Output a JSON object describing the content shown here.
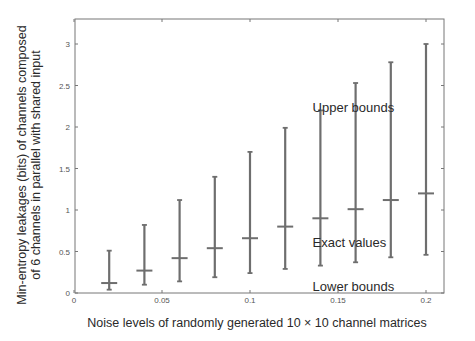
{
  "chart_data": {
    "type": "errorbar",
    "title": "",
    "xlabel": "Noise levels of randomly generated 10 × 10 channel matrices",
    "ylabel_lines": [
      "Min-entropy leakages (bits) of channels composed",
      "of 6 channels in parallel with shared input"
    ],
    "xlim": [
      0,
      0.21
    ],
    "ylim": [
      0,
      3.3
    ],
    "x_ticks": [
      0,
      0.05,
      0.1,
      0.15,
      0.2
    ],
    "x_tick_labels": [
      "0",
      "0.05",
      "0.1",
      "0.15",
      "0.2"
    ],
    "y_ticks": [
      0,
      0.5,
      1,
      1.5,
      2,
      2.5,
      3
    ],
    "y_tick_labels": [
      "0",
      "0.5",
      "1",
      "1.5",
      "2",
      "2.5",
      "3"
    ],
    "grid": false,
    "x": [
      0.02,
      0.04,
      0.06,
      0.08,
      0.1,
      0.12,
      0.14,
      0.16,
      0.18,
      0.2
    ],
    "series": [
      {
        "name": "Upper bounds",
        "values": [
          0.51,
          0.82,
          1.12,
          1.4,
          1.7,
          1.99,
          2.2,
          2.53,
          2.78,
          3.0
        ]
      },
      {
        "name": "Exact values",
        "values": [
          0.12,
          0.27,
          0.42,
          0.54,
          0.66,
          0.8,
          0.9,
          1.01,
          1.12,
          1.2
        ]
      },
      {
        "name": "Lower bounds",
        "values": [
          0.04,
          0.1,
          0.14,
          0.19,
          0.24,
          0.29,
          0.33,
          0.37,
          0.43,
          0.46
        ]
      }
    ],
    "annotations": [
      {
        "text": "Upper bounds",
        "x": 0.135,
        "y": 2.24
      },
      {
        "text": "Exact values",
        "x": 0.135,
        "y": 0.62
      },
      {
        "text": "Lower bounds",
        "x": 0.135,
        "y": 0.09
      }
    ],
    "colors": {
      "bars": "#6e6e6e",
      "axes": "#777777",
      "text": "#2a2a2a"
    }
  }
}
